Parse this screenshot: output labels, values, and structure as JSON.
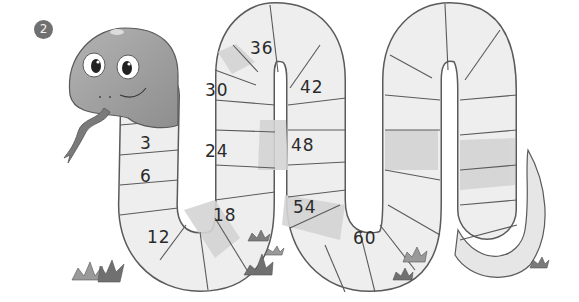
{
  "exercise": {
    "number_badge": "2",
    "description": "Snake counting-by-3 worksheet: fill in the blank segments"
  },
  "snake": {
    "segments_labeled": [
      {
        "label": "3",
        "x": 140,
        "y": 133
      },
      {
        "label": "6",
        "x": 140,
        "y": 166
      },
      {
        "label": "12",
        "x": 149,
        "y": 227
      },
      {
        "label": "18",
        "x": 213,
        "y": 205
      },
      {
        "label": "24",
        "x": 205,
        "y": 143
      },
      {
        "label": "30",
        "x": 205,
        "y": 79
      },
      {
        "label": "36",
        "x": 250,
        "y": 38
      },
      {
        "label": "42",
        "x": 300,
        "y": 77
      },
      {
        "label": "48",
        "x": 291,
        "y": 135
      },
      {
        "label": "54",
        "x": 293,
        "y": 197
      },
      {
        "label": "60",
        "x": 353,
        "y": 227
      }
    ]
  },
  "colors": {
    "outline": "#5a5a5a",
    "segment_light": "#f1f1f1",
    "segment_mid": "#e2e2e2",
    "segment_dark": "#cfcfcf",
    "head": "#9c9c9c",
    "grass": "#7d7d7d",
    "badge": "#707070"
  }
}
